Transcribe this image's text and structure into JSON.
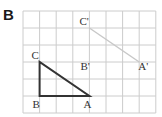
{
  "part_label": "B",
  "grid": {
    "cols": 8,
    "rows": 6,
    "x0": 23,
    "y0": 11,
    "cell_w": 16.6,
    "cell_h": 17,
    "line_color": "#cccccc"
  },
  "shapes": {
    "original": {
      "color": "#333333",
      "points": {
        "A": [
          4,
          5
        ],
        "B": [
          1,
          5
        ],
        "C": [
          1,
          3
        ]
      },
      "labels": {
        "A": "A",
        "B": "B",
        "C": "C"
      }
    },
    "image": {
      "color": "#c8c8c8",
      "points": {
        "A_prime": [
          7,
          3
        ],
        "B_prime": [
          4,
          3
        ],
        "C_prime": [
          4,
          1
        ]
      },
      "labels": {
        "A_prime": "A'",
        "B_prime": "B'",
        "C_prime": "C'"
      },
      "drawn_segments": [
        [
          "C_prime",
          "A_prime"
        ]
      ]
    }
  }
}
